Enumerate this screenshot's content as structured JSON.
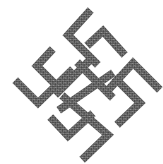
{
  "image": {
    "title": "Cross-stitch ornamental symbol",
    "subject": "rotated cross-stitch ornament with hooked arms",
    "background_color": "#ffffff",
    "stitch_color": "#5a5a5a",
    "stitch_highlight": "#8a8a8a",
    "stitch_pitch_px": 3.4,
    "band_width_px": 8
  },
  "bands": [
    {
      "name": "top-arm",
      "points": "88,13 68,35 95,62"
    },
    {
      "name": "upper-right-hook",
      "points": "90,43 103,31 122,52"
    },
    {
      "name": "right-arm",
      "points": "110,88 133,63 157,87"
    },
    {
      "name": "right-lower-hook",
      "points": "117,80 140,103 120,122"
    },
    {
      "name": "left-upper-hook",
      "points": "50,52 37,66 57,86"
    },
    {
      "name": "left-arm",
      "points": "18,83 38,103 70,72"
    },
    {
      "name": "bottom-arm",
      "points": "65,98 108,135 85,157"
    },
    {
      "name": "lower-left-hook",
      "points": "53,120 68,136 90,116"
    },
    {
      "name": "centre-diagonal-a",
      "points": "80,65 110,95"
    },
    {
      "name": "centre-diagonal-b",
      "points": "58,92 88,62"
    },
    {
      "name": "centre-diagonal-c",
      "points": "62,108 110,75"
    }
  ]
}
